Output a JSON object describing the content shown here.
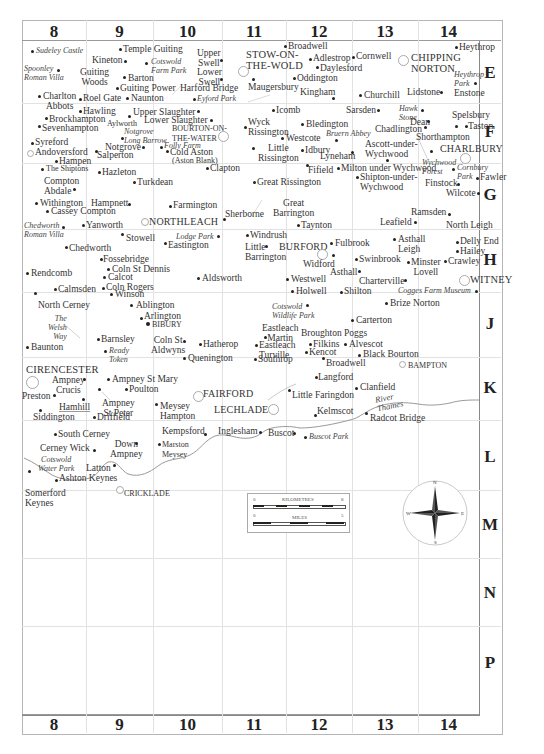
{
  "map": {
    "columns": [
      "8",
      "9",
      "10",
      "11",
      "12",
      "13",
      "14"
    ],
    "rows": [
      "E",
      "F",
      "G",
      "H",
      "J",
      "K",
      "L",
      "M",
      "N",
      "P"
    ],
    "colors": {
      "grid": "#e2e2e2",
      "frame": "#b5b5b5",
      "river": "#999999",
      "text": "#333333"
    },
    "places": [
      {
        "name": "Sudeley Castle",
        "style": "italic"
      },
      {
        "name": "Spoonley\nRoman Villa",
        "style": "italic"
      },
      {
        "name": "Charlton\nAbbots"
      },
      {
        "name": "Temple Guiting"
      },
      {
        "name": "Kineton"
      },
      {
        "name": "Cotswold\nFarm Park",
        "style": "italic"
      },
      {
        "name": "Guiting\nWoods"
      },
      {
        "name": "Barton"
      },
      {
        "name": "Guiting Power"
      },
      {
        "name": "Roel Gate"
      },
      {
        "name": "Naunton"
      },
      {
        "name": "Upper\nSwell"
      },
      {
        "name": "Lower\nSwell"
      },
      {
        "name": "Harford Bridge"
      },
      {
        "name": "Eyford Park",
        "style": "italic"
      },
      {
        "name": "STOW-ON-\nTHE-WOLD",
        "style": "town"
      },
      {
        "name": "Broadwell"
      },
      {
        "name": "Adlestrop"
      },
      {
        "name": "Cornwell"
      },
      {
        "name": "Daylesford"
      },
      {
        "name": "Oddington"
      },
      {
        "name": "Maugersbury"
      },
      {
        "name": "Kingham"
      },
      {
        "name": "Churchill"
      },
      {
        "name": "CHIPPING\nNORTON",
        "style": "town"
      },
      {
        "name": "Lidstone"
      },
      {
        "name": "Heythrop"
      },
      {
        "name": "Heythrop\nPark",
        "style": "italic"
      },
      {
        "name": "Enstone"
      },
      {
        "name": "Hawling"
      },
      {
        "name": "Brockhampton"
      },
      {
        "name": "Sevenhampton"
      },
      {
        "name": "Aylworth",
        "style": "small"
      },
      {
        "name": "Upper Slaughter"
      },
      {
        "name": "Lower Slaughter"
      },
      {
        "name": "Notgrove\nLong Barrow",
        "style": "italic"
      },
      {
        "name": "BOURTON-ON-\nTHE-WATER",
        "style": "small"
      },
      {
        "name": "Syreford"
      },
      {
        "name": "Andoversford"
      },
      {
        "name": "Notgrove"
      },
      {
        "name": "Folly Farm",
        "style": "italic"
      },
      {
        "name": "Salperton"
      },
      {
        "name": "Cold Aston"
      },
      {
        "name": "(Aston Blank)",
        "style": "small"
      },
      {
        "name": "Hampen"
      },
      {
        "name": "Icomb"
      },
      {
        "name": "Wyck\nRissington"
      },
      {
        "name": "Bledington"
      },
      {
        "name": "Sarsden"
      },
      {
        "name": "Hawk\nStone",
        "style": "italic"
      },
      {
        "name": "Dean"
      },
      {
        "name": "Chadlington"
      },
      {
        "name": "Spelsbury"
      },
      {
        "name": "Taston"
      },
      {
        "name": "Westcote"
      },
      {
        "name": "Bruern Abbey",
        "style": "italic"
      },
      {
        "name": "Shorthampton"
      },
      {
        "name": "Little\nRissington"
      },
      {
        "name": "Idbury"
      },
      {
        "name": "Lyneham"
      },
      {
        "name": "Ascott-under-\nWychwood"
      },
      {
        "name": "CHARLBURY",
        "style": "town"
      },
      {
        "name": "Wychwood\nForest",
        "style": "italic"
      },
      {
        "name": "Cornbury\nPark",
        "style": "italic"
      },
      {
        "name": "The Shiptons",
        "style": "small"
      },
      {
        "name": "Hazleton"
      },
      {
        "name": "Clapton"
      },
      {
        "name": "Fifield"
      },
      {
        "name": "Milton under Wychwood"
      },
      {
        "name": "Fawler"
      },
      {
        "name": "Compton\nAbdale"
      },
      {
        "name": "Turkdean"
      },
      {
        "name": "Great Rissington"
      },
      {
        "name": "Shipton-under-\nWychwood"
      },
      {
        "name": "Finstock"
      },
      {
        "name": "Wilcote"
      },
      {
        "name": "Withington"
      },
      {
        "name": "Hampnett"
      },
      {
        "name": "Farmington"
      },
      {
        "name": "Great\nBarrington"
      },
      {
        "name": "Cassey Compton"
      },
      {
        "name": "Sherborne"
      },
      {
        "name": "Ramsden"
      },
      {
        "name": "NORTHLEACH",
        "style": "town"
      },
      {
        "name": "Leafield"
      },
      {
        "name": "Chedworth\nRoman Villa",
        "style": "italic"
      },
      {
        "name": "Yanworth"
      },
      {
        "name": "Taynton"
      },
      {
        "name": "North Leigh"
      },
      {
        "name": "Stowell"
      },
      {
        "name": "Lodge Park",
        "style": "italic"
      },
      {
        "name": "Windrush"
      },
      {
        "name": "Asthall\nLeigh"
      },
      {
        "name": "Delly End"
      },
      {
        "name": "Chedworth"
      },
      {
        "name": "Eastington"
      },
      {
        "name": "Little\nBarrington"
      },
      {
        "name": "BURFORD",
        "style": "town"
      },
      {
        "name": "Fulbrook"
      },
      {
        "name": "Hailey"
      },
      {
        "name": "Fossebridge"
      },
      {
        "name": "Widford"
      },
      {
        "name": "Swinbrook"
      },
      {
        "name": "Minster\nLovell"
      },
      {
        "name": "Crawley"
      },
      {
        "name": "Coln St Dennis"
      },
      {
        "name": "Rendcomb"
      },
      {
        "name": "Calcot"
      },
      {
        "name": "Aldsworth"
      },
      {
        "name": "Asthall"
      },
      {
        "name": "Westwell"
      },
      {
        "name": "Charterville"
      },
      {
        "name": "WITNEY",
        "style": "town"
      },
      {
        "name": "Calmsden"
      },
      {
        "name": "Coln Rogers"
      },
      {
        "name": "Winson"
      },
      {
        "name": "Holwell"
      },
      {
        "name": "Shilton"
      },
      {
        "name": "Cogges Farm Museum",
        "style": "italic"
      },
      {
        "name": "North Cerney"
      },
      {
        "name": "Ablington"
      },
      {
        "name": "Cotswold\nWildlife Park",
        "style": "italic"
      },
      {
        "name": "Brize Norton"
      },
      {
        "name": "Arlington"
      },
      {
        "name": "BIBURY",
        "style": "small"
      },
      {
        "name": "The\nWelsh\nWay",
        "style": "italic"
      },
      {
        "name": "Carterton"
      },
      {
        "name": "Eastleach\nMartin"
      },
      {
        "name": "Broughton Poggs"
      },
      {
        "name": "Barnsley"
      },
      {
        "name": "Coln St\nAldwyns"
      },
      {
        "name": "Hatherop"
      },
      {
        "name": "Eastleach\nTurville"
      },
      {
        "name": "Filkins"
      },
      {
        "name": "Alvescot"
      },
      {
        "name": "Baunton"
      },
      {
        "name": "Ready\nToken",
        "style": "italic"
      },
      {
        "name": "Kencot"
      },
      {
        "name": "Black Bourton"
      },
      {
        "name": "Quenington"
      },
      {
        "name": "Southrop"
      },
      {
        "name": "Broadwell"
      },
      {
        "name": "BAMPTON",
        "style": "small"
      },
      {
        "name": "CIRENCESTER",
        "style": "town"
      },
      {
        "name": "Ampney\nCrucis"
      },
      {
        "name": "Ampney St Mary"
      },
      {
        "name": "Langford"
      },
      {
        "name": "Poulton"
      },
      {
        "name": "FAIRFORD",
        "style": "town"
      },
      {
        "name": "Clanfield"
      },
      {
        "name": "Preston"
      },
      {
        "name": "Little Faringdon"
      },
      {
        "name": "Hamhill"
      },
      {
        "name": "Ampney\nSt Peter"
      },
      {
        "name": "Meysey\nHampton"
      },
      {
        "name": "LECHLADE",
        "style": "town"
      },
      {
        "name": "Siddington"
      },
      {
        "name": "Driffield"
      },
      {
        "name": "Kelmscot"
      },
      {
        "name": "Radcot Bridge"
      },
      {
        "name": "River\nThames",
        "style": "italic"
      },
      {
        "name": "South Cerney"
      },
      {
        "name": "Kempsford"
      },
      {
        "name": "Inglesham"
      },
      {
        "name": "Buscot"
      },
      {
        "name": "Buscot Park",
        "style": "italic"
      },
      {
        "name": "Cerney Wick"
      },
      {
        "name": "Down\nAmpney"
      },
      {
        "name": "Marston\nMeysey",
        "style": "small"
      },
      {
        "name": "Cotswold\nWater Park",
        "style": "italic"
      },
      {
        "name": "Latton"
      },
      {
        "name": "Ashton Keynes"
      },
      {
        "name": "Somerford\nKeynes"
      },
      {
        "name": "CRICKLADE",
        "style": "small"
      }
    ],
    "scale_bar": {
      "kilometres_label": "KILOMETRES",
      "km_start": "0",
      "km_end": "8",
      "miles_label": "MILES",
      "mi_start": "0",
      "mi_end": "5"
    },
    "compass": {
      "n": "N",
      "s": "S",
      "e": "E",
      "w": "W"
    }
  }
}
